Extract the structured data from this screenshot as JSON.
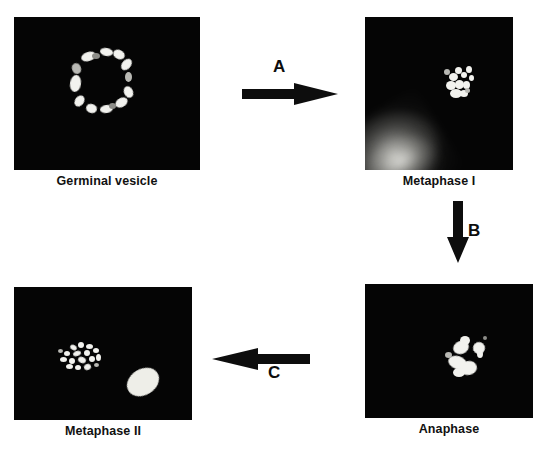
{
  "figure": {
    "background_color": "#ffffff",
    "panel_background_color": "#050505",
    "chromatin_color": "#f2f2ee",
    "label_color": "#111111"
  },
  "panels": [
    {
      "id": "germinal-vesicle",
      "label": "Germinal vesicle",
      "description": "ring of bright chromatin foci around nuclear envelope"
    },
    {
      "id": "metaphase-i",
      "label": "Metaphase I",
      "description": "compact bright chromosome cluster right of centre with diffuse glow at lower-left corner"
    },
    {
      "id": "anaphase",
      "label": "Anaphase",
      "description": "two separating bright chromatin masses near centre"
    },
    {
      "id": "metaphase-ii",
      "label": "Metaphase II",
      "description": "scattered chromosome spread at left with large bright oval polar body at lower right"
    }
  ],
  "arrows": [
    {
      "id": "a",
      "label": "A",
      "direction": "right",
      "from": "germinal-vesicle",
      "to": "metaphase-i"
    },
    {
      "id": "b",
      "label": "B",
      "direction": "down",
      "from": "metaphase-i",
      "to": "anaphase"
    },
    {
      "id": "c",
      "label": "C",
      "direction": "left",
      "from": "anaphase",
      "to": "metaphase-ii"
    }
  ]
}
